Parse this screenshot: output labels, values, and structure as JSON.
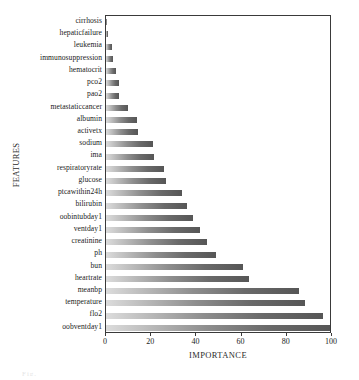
{
  "chart_data": {
    "type": "bar",
    "orientation": "horizontal",
    "title": "",
    "xlabel": "IMPORTANCE",
    "ylabel": "FEATURES",
    "xlim": [
      0,
      100
    ],
    "xticks": [
      0,
      20,
      40,
      60,
      80,
      100
    ],
    "grid": false,
    "legend": null,
    "bar_color": "#6a6a6a",
    "categories": [
      "cirrhosis",
      "hepaticfailure",
      "leukemia",
      "immunosuppression",
      "hematocrit",
      "pco2",
      "pao2",
      "metastaticcancer",
      "albumin",
      "activetx",
      "sodium",
      "ima",
      "respiratoryrate",
      "glucose",
      "ptcawithin24h",
      "bilirubin",
      "oobintubday1",
      "ventday1",
      "creatinine",
      "ph",
      "bun",
      "heartrate",
      "meanbp",
      "temperature",
      "flo2",
      "oobventday1"
    ],
    "values": [
      0.4,
      0.8,
      2.7,
      3.3,
      4.6,
      6.0,
      6.0,
      10.0,
      14.0,
      14.5,
      21.0,
      21.5,
      26.0,
      27.0,
      34.0,
      36.0,
      39.0,
      42.0,
      45.0,
      49.0,
      61.0,
      64.0,
      86.0,
      89.0,
      97.0,
      100.0
    ]
  },
  "caption_fragment": "Fig."
}
